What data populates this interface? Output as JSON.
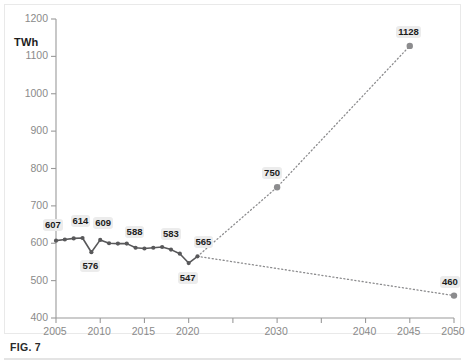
{
  "figure": {
    "caption": "FIG. 7",
    "unit_label": "TWh"
  },
  "colors": {
    "line": "#58585a",
    "marker": "#58585a",
    "projection": "#8c8c8e",
    "axis": "#9a9a9a",
    "tick_text": "#8a8a8a",
    "label_text": "#1c1c1c",
    "label_background": "#ececec",
    "frame": "#e9e9e9",
    "background": "#ffffff"
  },
  "chart_data": {
    "type": "line",
    "title": "",
    "xlabel": "",
    "ylabel": "TWh",
    "xlim": [
      2005,
      2050
    ],
    "ylim": [
      400,
      1200
    ],
    "grid": false,
    "legend": "none",
    "y_ticks": [
      400,
      500,
      600,
      700,
      800,
      900,
      1000,
      1100,
      1200
    ],
    "x_ticks": [
      2005,
      2010,
      2015,
      2020,
      2025,
      2030,
      2035,
      2040,
      2045,
      2050
    ],
    "x_tick_labels": [
      "2005",
      "2010",
      "2015",
      "2020",
      "",
      "2030",
      "",
      "2040",
      "2045",
      "2050"
    ],
    "series": [
      {
        "name": "Historical",
        "style": "solid-with-markers",
        "x": [
          2005,
          2006,
          2007,
          2008,
          2009,
          2010,
          2011,
          2012,
          2013,
          2014,
          2015,
          2016,
          2017,
          2018,
          2019,
          2020,
          2021
        ],
        "values": [
          607,
          610,
          613,
          614,
          576,
          609,
          600,
          599,
          599,
          588,
          586,
          588,
          590,
          583,
          572,
          547,
          565
        ]
      },
      {
        "name": "High projection",
        "style": "dotted",
        "x": [
          2021,
          2030,
          2045
        ],
        "values": [
          565,
          750,
          1128
        ]
      },
      {
        "name": "Low projection",
        "style": "dotted",
        "x": [
          2021,
          2050
        ],
        "values": [
          565,
          460
        ]
      }
    ],
    "point_labels": [
      {
        "x": 2005,
        "value": 607,
        "text": "607",
        "dx": -2,
        "dy": -15,
        "boxed": true
      },
      {
        "x": 2008,
        "value": 614,
        "text": "614",
        "dx": -1,
        "dy": -16,
        "boxed": true
      },
      {
        "x": 2009,
        "value": 576,
        "text": "576",
        "dx": 0,
        "dy": 15,
        "boxed": true
      },
      {
        "x": 2010,
        "value": 609,
        "text": "609",
        "dx": 4,
        "dy": -16,
        "boxed": true
      },
      {
        "x": 2014,
        "value": 588,
        "text": "588",
        "dx": 0,
        "dy": -15,
        "boxed": true
      },
      {
        "x": 2018,
        "value": 583,
        "text": "583",
        "dx": 1,
        "dy": -15,
        "boxed": true
      },
      {
        "x": 2020,
        "value": 547,
        "text": "547",
        "dx": 0,
        "dy": 16,
        "boxed": true
      },
      {
        "x": 2021,
        "value": 565,
        "text": "565",
        "dx": 7,
        "dy": -13,
        "boxed": true
      },
      {
        "x": 2030,
        "value": 750,
        "text": "750",
        "dx": -4,
        "dy": -13,
        "boxed": true
      },
      {
        "x": 2045,
        "value": 1128,
        "text": "1128",
        "dx": 0,
        "dy": -13,
        "boxed": true
      },
      {
        "x": 2050,
        "value": 460,
        "text": "460",
        "dx": -3,
        "dy": -13,
        "boxed": true
      }
    ]
  }
}
